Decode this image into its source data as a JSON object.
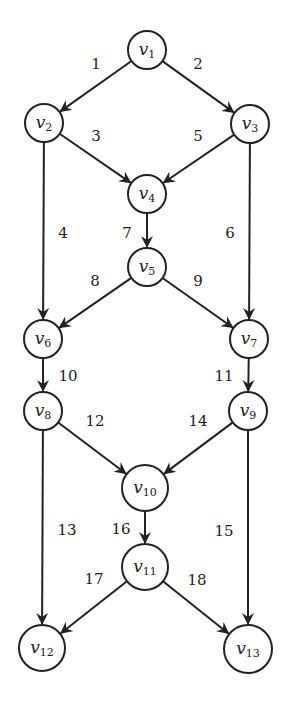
{
  "diagram": {
    "type": "directed-graph",
    "nodes": [
      {
        "id": "v1",
        "name": "v",
        "sub": "1",
        "x": 147,
        "y": 50,
        "r": 19
      },
      {
        "id": "v2",
        "name": "v",
        "sub": "2",
        "x": 44,
        "y": 123,
        "r": 19
      },
      {
        "id": "v3",
        "name": "v",
        "sub": "3",
        "x": 250,
        "y": 124,
        "r": 19
      },
      {
        "id": "v4",
        "name": "v",
        "sub": "4",
        "x": 147,
        "y": 194,
        "r": 19
      },
      {
        "id": "v5",
        "name": "v",
        "sub": "5",
        "x": 147,
        "y": 267,
        "r": 19
      },
      {
        "id": "v6",
        "name": "v",
        "sub": "6",
        "x": 43,
        "y": 339,
        "r": 19
      },
      {
        "id": "v7",
        "name": "v",
        "sub": "7",
        "x": 249,
        "y": 339,
        "r": 19
      },
      {
        "id": "v8",
        "name": "v",
        "sub": "8",
        "x": 43,
        "y": 411,
        "r": 19
      },
      {
        "id": "v9",
        "name": "v",
        "sub": "9",
        "x": 248,
        "y": 411,
        "r": 19
      },
      {
        "id": "v10",
        "name": "v",
        "sub": "10",
        "x": 145,
        "y": 488,
        "r": 23
      },
      {
        "id": "v11",
        "name": "v",
        "sub": "11",
        "x": 145,
        "y": 567,
        "r": 23
      },
      {
        "id": "v12",
        "name": "v",
        "sub": "12",
        "x": 42,
        "y": 648,
        "r": 23
      },
      {
        "id": "v13",
        "name": "v",
        "sub": "13",
        "x": 248,
        "y": 649,
        "r": 24
      }
    ],
    "edges": [
      {
        "label": "1",
        "from": "v1",
        "to": "v2",
        "lx": 96,
        "ly": 69
      },
      {
        "label": "2",
        "from": "v1",
        "to": "v3",
        "lx": 198,
        "ly": 69
      },
      {
        "label": "3",
        "from": "v2",
        "to": "v4",
        "lx": 96,
        "ly": 141
      },
      {
        "label": "4",
        "from": "v2",
        "to": "v6",
        "lx": 63,
        "ly": 238
      },
      {
        "label": "5",
        "from": "v3",
        "to": "v4",
        "lx": 198,
        "ly": 141
      },
      {
        "label": "6",
        "from": "v3",
        "to": "v7",
        "lx": 230,
        "ly": 238
      },
      {
        "label": "7",
        "from": "v4",
        "to": "v5",
        "lx": 127,
        "ly": 238
      },
      {
        "label": "8",
        "from": "v5",
        "to": "v6",
        "lx": 95,
        "ly": 286
      },
      {
        "label": "9",
        "from": "v5",
        "to": "v7",
        "lx": 198,
        "ly": 286
      },
      {
        "label": "10",
        "from": "v6",
        "to": "v8",
        "lx": 68,
        "ly": 381
      },
      {
        "label": "11",
        "from": "v7",
        "to": "v9",
        "lx": 224,
        "ly": 381
      },
      {
        "label": "12",
        "from": "v8",
        "to": "v10",
        "lx": 95,
        "ly": 426
      },
      {
        "label": "13",
        "from": "v8",
        "to": "v12",
        "lx": 67,
        "ly": 535
      },
      {
        "label": "14",
        "from": "v9",
        "to": "v10",
        "lx": 198,
        "ly": 426
      },
      {
        "label": "15",
        "from": "v9",
        "to": "v13",
        "lx": 224,
        "ly": 536
      },
      {
        "label": "16",
        "from": "v10",
        "to": "v11",
        "lx": 121,
        "ly": 534
      },
      {
        "label": "17",
        "from": "v11",
        "to": "v12",
        "lx": 94,
        "ly": 584
      },
      {
        "label": "18",
        "from": "v11",
        "to": "v13",
        "lx": 197,
        "ly": 585
      }
    ],
    "colors": {
      "stroke": "#222222",
      "background": "#ffffff"
    }
  }
}
